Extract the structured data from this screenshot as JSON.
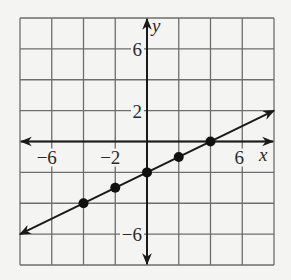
{
  "chart_data": {
    "type": "line",
    "title": "",
    "xlabel": "x",
    "ylabel": "y",
    "xlim": [
      -8,
      8
    ],
    "ylim": [
      -8,
      8
    ],
    "grid": true,
    "grid_step": 2,
    "x_tick_labels": [
      {
        "value": -6,
        "label": "−6"
      },
      {
        "value": -2,
        "label": "−2"
      },
      {
        "value": 6,
        "label": "6"
      }
    ],
    "y_tick_labels": [
      {
        "value": 6,
        "label": "6"
      },
      {
        "value": 2,
        "label": "2"
      },
      {
        "value": -6,
        "label": "−6"
      }
    ],
    "series": [
      {
        "name": "line",
        "equation": "y = x/2 - 2",
        "points": [
          {
            "x": -4,
            "y": -4
          },
          {
            "x": -2,
            "y": -3
          },
          {
            "x": 0,
            "y": -2
          },
          {
            "x": 2,
            "y": -1
          },
          {
            "x": 4,
            "y": 0
          }
        ],
        "line_extent": [
          {
            "x": -8,
            "y": -6
          },
          {
            "x": 8,
            "y": 2
          }
        ],
        "arrows_both_ends": true
      }
    ],
    "legend": null
  },
  "colors": {
    "background": "#f4f4f2",
    "grid": "#6e6e6e",
    "ink": "#1a1a1a"
  }
}
